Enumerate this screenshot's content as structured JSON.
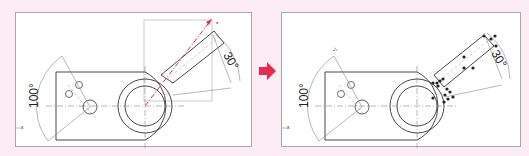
{
  "colors": {
    "background": "#fbedf3",
    "panel_border": "#a8a8a8",
    "line": "#333333",
    "construction": "#9a9a9a",
    "highlight": "#e0303f",
    "arrow": "#ea2a4c",
    "point": "#222222"
  },
  "before": {
    "angle_left_label": "100°",
    "angle_right_label": "30°",
    "axis_label": "x",
    "end_marker": "*"
  },
  "after": {
    "angle_left_label": "100°",
    "angle_right_label": "30°",
    "axis_label": "x",
    "top_marker": "*/"
  },
  "transition": {
    "icon": "right-arrow-icon"
  }
}
